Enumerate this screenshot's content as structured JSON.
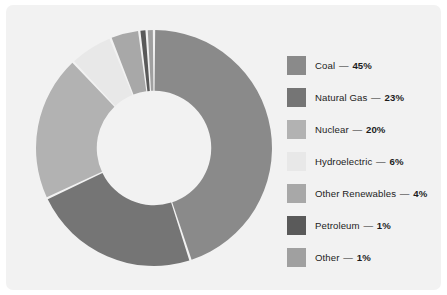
{
  "panel": {
    "background_color": "#f2f2f2",
    "page_background_color": "#ffffff"
  },
  "chart_data": {
    "type": "pie",
    "variant": "donut",
    "title": "",
    "subtitle": "",
    "xlabel": "",
    "ylabel": "",
    "legend_position": "right",
    "grid": false,
    "separator_color": "#f2f2f2",
    "start_angle_deg": 0,
    "direction": "clockwise",
    "inner_radius_ratio": 0.485,
    "units": "%",
    "total": 100,
    "categories": [
      "Coal",
      "Natural Gas",
      "Nuclear",
      "Hydroelectric",
      "Other Renewables",
      "Petroleum",
      "Other"
    ],
    "values": [
      45,
      23,
      20,
      6,
      4,
      1,
      1
    ],
    "colors": [
      "#8a8a8a",
      "#757575",
      "#b2b2b2",
      "#e8e8e8",
      "#a8a8a8",
      "#5a5a5a",
      "#a0a0a0"
    ],
    "slices": [
      {
        "label": "Coal",
        "value": 45,
        "display": "45%",
        "color": "#8a8a8a"
      },
      {
        "label": "Natural Gas",
        "value": 23,
        "display": "23%",
        "color": "#757575"
      },
      {
        "label": "Nuclear",
        "value": 20,
        "display": "20%",
        "color": "#b2b2b2"
      },
      {
        "label": "Hydroelectric",
        "value": 6,
        "display": "6%",
        "color": "#e8e8e8"
      },
      {
        "label": "Other Renewables",
        "value": 4,
        "display": "4%",
        "color": "#a8a8a8"
      },
      {
        "label": "Petroleum",
        "value": 1,
        "display": "1%",
        "color": "#5a5a5a"
      },
      {
        "label": "Other",
        "value": 1,
        "display": "1%",
        "color": "#a0a0a0"
      }
    ]
  },
  "legend": {
    "separator": "—",
    "items": [
      {
        "label": "Coal",
        "percent": "45%",
        "color": "#8a8a8a"
      },
      {
        "label": "Natural Gas",
        "percent": "23%",
        "color": "#757575"
      },
      {
        "label": "Nuclear",
        "percent": "20%",
        "color": "#b2b2b2"
      },
      {
        "label": "Hydroelectric",
        "percent": "6%",
        "color": "#e8e8e8"
      },
      {
        "label": "Other Renewables",
        "percent": "4%",
        "color": "#a8a8a8"
      },
      {
        "label": "Petroleum",
        "percent": "1%",
        "color": "#5a5a5a"
      },
      {
        "label": "Other",
        "percent": "1%",
        "color": "#a0a0a0"
      }
    ]
  }
}
